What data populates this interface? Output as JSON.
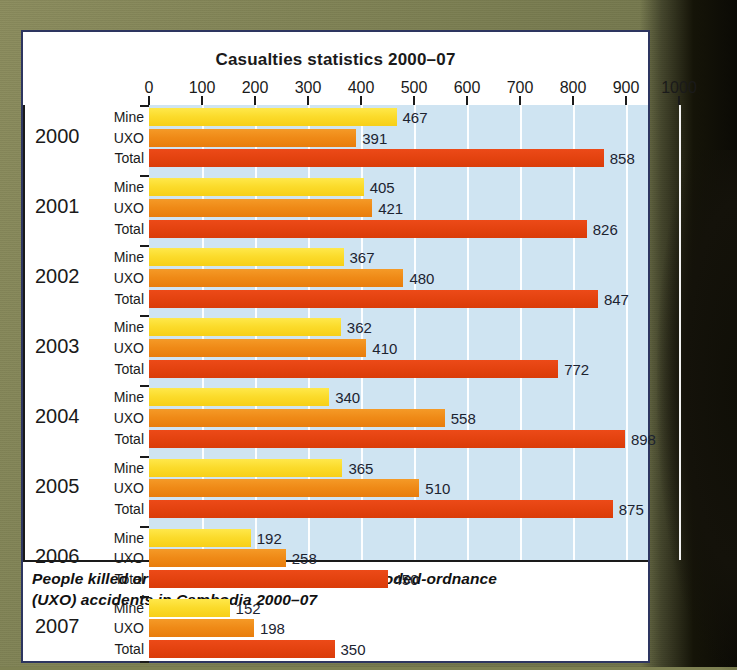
{
  "chart_data": {
    "type": "bar",
    "orientation": "horizontal",
    "title": "Casualties statistics 2000–07",
    "xlabel": "",
    "ylabel": "",
    "xlim": [
      0,
      1000
    ],
    "xticks": [
      0,
      100,
      200,
      300,
      400,
      500,
      600,
      700,
      800,
      900,
      1000
    ],
    "grid": true,
    "grid_axis": "x",
    "legend": false,
    "row_labels": [
      "Mine",
      "UXO",
      "Total"
    ],
    "categories": [
      "2000",
      "2001",
      "2002",
      "2003",
      "2004",
      "2005",
      "2006",
      "2007"
    ],
    "series": [
      {
        "name": "Mine",
        "color": "#fbdb2b",
        "values": [
          467,
          405,
          367,
          362,
          340,
          365,
          192,
          152
        ]
      },
      {
        "name": "UXO",
        "color": "#ef8a17",
        "values": [
          391,
          421,
          480,
          410,
          558,
          510,
          258,
          198
        ]
      },
      {
        "name": "Total",
        "color": "#e44310",
        "values": [
          858,
          826,
          847,
          772,
          898,
          875,
          450,
          350
        ]
      }
    ],
    "groups": [
      {
        "year": "2000",
        "rows": [
          {
            "label": "Mine",
            "value": 467,
            "series": "Mine"
          },
          {
            "label": "UXO",
            "value": 391,
            "series": "UXO"
          },
          {
            "label": "Total",
            "value": 858,
            "series": "Total"
          }
        ]
      },
      {
        "year": "2001",
        "rows": [
          {
            "label": "Mine",
            "value": 405,
            "series": "Mine"
          },
          {
            "label": "UXO",
            "value": 421,
            "series": "UXO"
          },
          {
            "label": "Total",
            "value": 826,
            "series": "Total"
          }
        ]
      },
      {
        "year": "2002",
        "rows": [
          {
            "label": "Mine",
            "value": 367,
            "series": "Mine"
          },
          {
            "label": "UXO",
            "value": 480,
            "series": "UXO"
          },
          {
            "label": "Total",
            "value": 847,
            "series": "Total"
          }
        ]
      },
      {
        "year": "2003",
        "rows": [
          {
            "label": "Mine",
            "value": 362,
            "series": "Mine"
          },
          {
            "label": "UXO",
            "value": 410,
            "series": "UXO"
          },
          {
            "label": "Total",
            "value": 772,
            "series": "Total"
          }
        ]
      },
      {
        "year": "2004",
        "rows": [
          {
            "label": "Mine",
            "value": 340,
            "series": "Mine"
          },
          {
            "label": "UXO",
            "value": 558,
            "series": "UXO"
          },
          {
            "label": "Total",
            "value": 898,
            "series": "Total"
          }
        ]
      },
      {
        "year": "2005",
        "rows": [
          {
            "label": "Mine",
            "value": 365,
            "series": "Mine"
          },
          {
            "label": "UXO",
            "value": 510,
            "series": "UXO"
          },
          {
            "label": "Total",
            "value": 875,
            "series": "Total"
          }
        ]
      },
      {
        "year": "2006",
        "rows": [
          {
            "label": "Mine",
            "value": 192,
            "series": "Mine"
          },
          {
            "label": "UXO",
            "value": 258,
            "series": "UXO"
          },
          {
            "label": "Total",
            "value": 450,
            "series": "Total"
          }
        ]
      },
      {
        "year": "2007",
        "rows": [
          {
            "label": "Mine",
            "value": 152,
            "series": "Mine"
          },
          {
            "label": "UXO",
            "value": 198,
            "series": "UXO"
          },
          {
            "label": "Total",
            "value": 350,
            "series": "Total"
          }
        ]
      }
    ],
    "colors": {
      "mine": "#fbdb2b",
      "uxo": "#ef8a17",
      "total": "#e44310",
      "plot_background": "#cfe4f2",
      "gridline": "#ffffff",
      "axis": "#1a1a1a",
      "card_background": "#ffffff",
      "card_border": "#2d3560",
      "page_background": "#7d8053",
      "value_text": "#1c2330"
    }
  },
  "caption": {
    "line1": "People killed or injured in landmine and unexploded-ordnance",
    "line2": "(UXO) accidents in Cambodia 2000–07"
  }
}
